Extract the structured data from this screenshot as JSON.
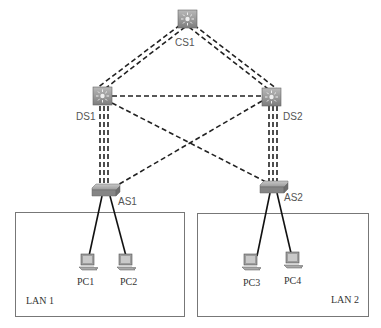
{
  "diagram": {
    "type": "network-topology",
    "nodes": {
      "CS1": {
        "label": "CS1",
        "kind": "multilayer-switch",
        "role": "core"
      },
      "DS1": {
        "label": "DS1",
        "kind": "multilayer-switch",
        "role": "distribution"
      },
      "DS2": {
        "label": "DS2",
        "kind": "multilayer-switch",
        "role": "distribution"
      },
      "AS1": {
        "label": "AS1",
        "kind": "switch",
        "role": "access"
      },
      "AS2": {
        "label": "AS2",
        "kind": "switch",
        "role": "access"
      },
      "PC1": {
        "label": "PC1",
        "kind": "pc"
      },
      "PC2": {
        "label": "PC2",
        "kind": "pc"
      },
      "PC3": {
        "label": "PC3",
        "kind": "pc"
      },
      "PC4": {
        "label": "PC4",
        "kind": "pc"
      }
    },
    "links": [
      {
        "from": "CS1",
        "to": "DS1",
        "style": "double-dashed"
      },
      {
        "from": "CS1",
        "to": "DS2",
        "style": "double-dashed"
      },
      {
        "from": "DS1",
        "to": "DS2",
        "style": "dashed"
      },
      {
        "from": "DS1",
        "to": "AS1",
        "style": "double-dashed"
      },
      {
        "from": "DS2",
        "to": "AS2",
        "style": "double-dashed"
      },
      {
        "from": "DS1",
        "to": "AS2",
        "style": "dashed"
      },
      {
        "from": "DS2",
        "to": "AS1",
        "style": "dashed"
      },
      {
        "from": "AS1",
        "to": "PC1",
        "style": "solid"
      },
      {
        "from": "AS1",
        "to": "PC2",
        "style": "solid"
      },
      {
        "from": "AS2",
        "to": "PC3",
        "style": "solid"
      },
      {
        "from": "AS2",
        "to": "PC4",
        "style": "solid"
      }
    ],
    "groups": [
      {
        "label": "LAN 1",
        "members": [
          "PC1",
          "PC2"
        ]
      },
      {
        "label": "LAN 2",
        "members": [
          "PC3",
          "PC4"
        ]
      }
    ]
  }
}
